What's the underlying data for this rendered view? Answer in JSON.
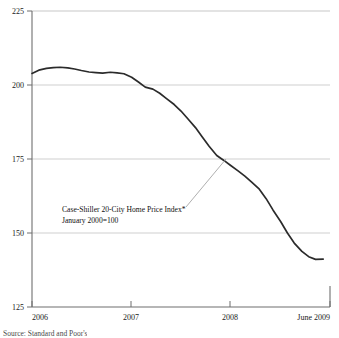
{
  "chart_data": {
    "type": "line",
    "title": "",
    "xlabel": "",
    "ylabel": "",
    "ylim": [
      125,
      225
    ],
    "yticks": [
      125,
      150,
      175,
      200,
      225
    ],
    "ytick_labels": [
      "125",
      "150",
      "175",
      "200",
      "225"
    ],
    "xlim": [
      2006.0,
      2009.5
    ],
    "xticks": [
      2006.0,
      2007.0,
      2008.0,
      2009.5
    ],
    "xtick_labels": [
      "2006",
      "2007",
      "2008",
      "June 2009"
    ],
    "grid": true,
    "grid_axis": "y",
    "legend": "none",
    "line_color": "#2b2b2b",
    "grid_color": "#bfbfbf",
    "axis_color": "#6b6b6b",
    "series": [
      {
        "name": "Case-Shiller 20-City Home Price Index",
        "x": [
          2006.0,
          2006.08,
          2006.17,
          2006.25,
          2006.33,
          2006.42,
          2006.5,
          2006.58,
          2006.67,
          2006.75,
          2006.83,
          2006.92,
          2007.0,
          2007.08,
          2007.17,
          2007.25,
          2007.33,
          2007.42,
          2007.5,
          2007.58,
          2007.67,
          2007.75,
          2007.83,
          2007.92,
          2008.0,
          2008.08,
          2008.17,
          2008.25,
          2008.33,
          2008.42,
          2008.5,
          2008.58,
          2008.67,
          2008.75,
          2008.83,
          2008.92,
          2009.0,
          2009.08,
          2009.17,
          2009.25,
          2009.33,
          2009.42
        ],
        "y": [
          203.9,
          205.0,
          205.6,
          205.9,
          206.0,
          205.8,
          205.4,
          204.9,
          204.4,
          204.2,
          204.0,
          204.3,
          204.1,
          203.8,
          202.6,
          201.0,
          199.3,
          198.6,
          197.2,
          195.4,
          193.4,
          191.2,
          188.6,
          185.6,
          182.4,
          179.3,
          176.2,
          174.6,
          172.9,
          171.0,
          169.2,
          167.2,
          164.8,
          161.6,
          157.8,
          153.9,
          150.0,
          146.6,
          143.8,
          142.0,
          141.1,
          141.2
        ]
      }
    ],
    "annotations": [
      {
        "name": "series-callout",
        "line1": "Case-Shiller 20-City Home Price Index*",
        "line2": "January 2000=100",
        "text_x": 62,
        "text_y": 212,
        "leader_from_x": 186,
        "leader_from_y": 207,
        "leader_to_x": 226,
        "leader_to_y": 159
      }
    ]
  },
  "source_note": "Source: Standard and Poor's"
}
